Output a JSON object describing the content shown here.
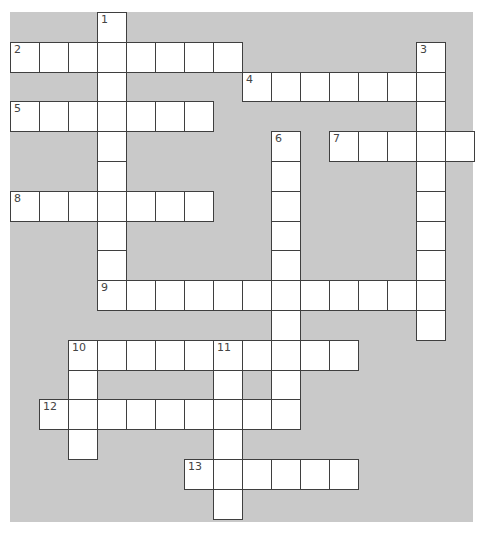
{
  "puzzle": {
    "type": "crossword",
    "grid": {
      "cell_width": 29,
      "cell_height": 29.8,
      "origin_x": 10,
      "origin_y": 12
    },
    "colors": {
      "background": "#c9c9c9",
      "cell": "#ffffff",
      "border": "#3f3f3f",
      "number": "#444444"
    },
    "entries": [
      {
        "number": "1",
        "direction": "down",
        "row": 0,
        "col": 3,
        "length": 10
      },
      {
        "number": "2",
        "direction": "across",
        "row": 1,
        "col": 0,
        "length": 8
      },
      {
        "number": "3",
        "direction": "down",
        "row": 1,
        "col": 14,
        "length": 10
      },
      {
        "number": "4",
        "direction": "across",
        "row": 2,
        "col": 8,
        "length": 7
      },
      {
        "number": "5",
        "direction": "across",
        "row": 3,
        "col": 0,
        "length": 7
      },
      {
        "number": "6",
        "direction": "down",
        "row": 4,
        "col": 9,
        "length": 10
      },
      {
        "number": "7",
        "direction": "across",
        "row": 4,
        "col": 11,
        "length": 5
      },
      {
        "number": "8",
        "direction": "across",
        "row": 6,
        "col": 0,
        "length": 7
      },
      {
        "number": "9",
        "direction": "across",
        "row": 9,
        "col": 3,
        "length": 12
      },
      {
        "number": "10",
        "direction": "across",
        "row": 11,
        "col": 2,
        "length": 10
      },
      {
        "number": "10",
        "direction": "down",
        "row": 11,
        "col": 2,
        "length": 4
      },
      {
        "number": "11",
        "direction": "down",
        "row": 11,
        "col": 7,
        "length": 6
      },
      {
        "number": "12",
        "direction": "across",
        "row": 13,
        "col": 1,
        "length": 9
      },
      {
        "number": "13",
        "direction": "across",
        "row": 15,
        "col": 6,
        "length": 6
      }
    ]
  }
}
